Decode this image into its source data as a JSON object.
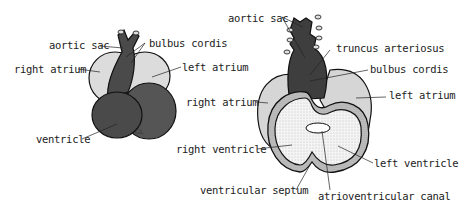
{
  "figures": [
    {
      "id": "early-heart",
      "labels": {
        "aortic_sac": "aortic sac",
        "bulbus_cordis": "bulbus cordis",
        "right_atrium": "right atrium",
        "left_atrium": "left atrium",
        "ventricle": "ventricle"
      },
      "signature": "GL"
    },
    {
      "id": "later-heart-section",
      "labels": {
        "aortic_sac": "aortic sac",
        "truncus_arteriosus": "truncus arteriosus",
        "bulbus_cordis": "bulbus cordis",
        "right_atrium": "right atrium",
        "left_atrium": "left atrium",
        "right_ventricle": "right ventricle",
        "left_ventricle": "left ventricle",
        "ventricular_septum": "ventricular septum",
        "atrioventricular_canal": "atrioventricular canal"
      }
    }
  ],
  "colors": {
    "dark_tissue": "#4a4a4a",
    "atrium": "#d8d8d8",
    "ventricle_inner": "#f2f2f2",
    "wall": "#bdbdbd",
    "outline": "#111111"
  }
}
